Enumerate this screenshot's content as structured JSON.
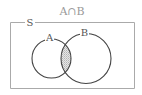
{
  "diagram": {
    "type": "venn",
    "title": "A∩B",
    "universe_label": "S",
    "sets": [
      {
        "name": "A",
        "label": "A"
      },
      {
        "name": "B",
        "label": "B"
      }
    ],
    "shaded_region": "A∩B",
    "colors": {
      "stroke": "#444444",
      "frame": "#aaaaaa",
      "shade": "#d0d0d0",
      "title": "#999999"
    }
  }
}
